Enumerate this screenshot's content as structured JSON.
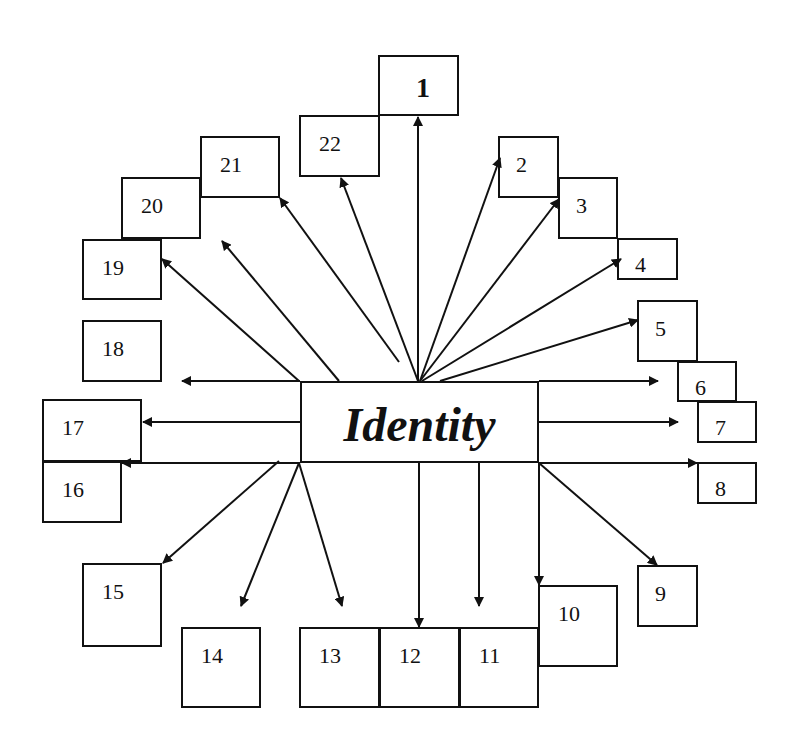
{
  "diagram": {
    "center": {
      "label": "Identity",
      "x": 300,
      "y": 381,
      "w": 239,
      "h": 82
    },
    "boxes": [
      {
        "id": "1",
        "label": "1",
        "x": 378,
        "y": 55,
        "w": 81,
        "h": 61,
        "bold": true
      },
      {
        "id": "2",
        "label": "2",
        "x": 498,
        "y": 136,
        "w": 61,
        "h": 62
      },
      {
        "id": "3",
        "label": "3",
        "x": 558,
        "y": 177,
        "w": 60,
        "h": 62
      },
      {
        "id": "4",
        "label": "4",
        "x": 617,
        "y": 238,
        "w": 61,
        "h": 42
      },
      {
        "id": "5",
        "label": "5",
        "x": 637,
        "y": 300,
        "w": 61,
        "h": 62
      },
      {
        "id": "6",
        "label": "6",
        "x": 677,
        "y": 361,
        "w": 60,
        "h": 41
      },
      {
        "id": "7",
        "label": "7",
        "x": 697,
        "y": 401,
        "w": 60,
        "h": 42
      },
      {
        "id": "8",
        "label": "8",
        "x": 697,
        "y": 462,
        "w": 60,
        "h": 42
      },
      {
        "id": "9",
        "label": "9",
        "x": 637,
        "y": 565,
        "w": 61,
        "h": 62
      },
      {
        "id": "10",
        "label": "10",
        "x": 538,
        "y": 585,
        "w": 80,
        "h": 82
      },
      {
        "id": "11",
        "label": "11",
        "x": 459,
        "y": 627,
        "w": 80,
        "h": 81
      },
      {
        "id": "12",
        "label": "12",
        "x": 379,
        "y": 627,
        "w": 81,
        "h": 81
      },
      {
        "id": "13",
        "label": "13",
        "x": 299,
        "y": 627,
        "w": 81,
        "h": 81
      },
      {
        "id": "14",
        "label": "14",
        "x": 181,
        "y": 627,
        "w": 80,
        "h": 81
      },
      {
        "id": "15",
        "label": "15",
        "x": 82,
        "y": 563,
        "w": 80,
        "h": 84
      },
      {
        "id": "16",
        "label": "16",
        "x": 42,
        "y": 461,
        "w": 80,
        "h": 62
      },
      {
        "id": "17",
        "label": "17",
        "x": 42,
        "y": 399,
        "w": 100,
        "h": 63
      },
      {
        "id": "18",
        "label": "18",
        "x": 82,
        "y": 320,
        "w": 80,
        "h": 62
      },
      {
        "id": "19",
        "label": "19",
        "x": 82,
        "y": 239,
        "w": 80,
        "h": 61
      },
      {
        "id": "20",
        "label": "20",
        "x": 121,
        "y": 177,
        "w": 80,
        "h": 62
      },
      {
        "id": "21",
        "label": "21",
        "x": 200,
        "y": 136,
        "w": 80,
        "h": 62
      },
      {
        "id": "22",
        "label": "22",
        "x": 299,
        "y": 115,
        "w": 81,
        "h": 62
      }
    ],
    "arrows": [
      {
        "to": "1",
        "x1": 418,
        "y1": 381,
        "x2": 418,
        "y2": 117
      },
      {
        "to": "2",
        "x1": 420,
        "y1": 381,
        "x2": 500,
        "y2": 158
      },
      {
        "to": "3",
        "x1": 420,
        "y1": 381,
        "x2": 559,
        "y2": 199
      },
      {
        "to": "4",
        "x1": 422,
        "y1": 381,
        "x2": 621,
        "y2": 259
      },
      {
        "to": "5",
        "x1": 440,
        "y1": 381,
        "x2": 638,
        "y2": 320
      },
      {
        "to": "6",
        "x1": 539,
        "y1": 381,
        "x2": 658,
        "y2": 381
      },
      {
        "to": "7",
        "x1": 539,
        "y1": 422,
        "x2": 678,
        "y2": 422
      },
      {
        "to": "8",
        "x1": 539,
        "y1": 463,
        "x2": 697,
        "y2": 463
      },
      {
        "to": "9",
        "x1": 539,
        "y1": 463,
        "x2": 657,
        "y2": 565
      },
      {
        "to": "10",
        "x1": 539,
        "y1": 463,
        "x2": 539,
        "y2": 585
      },
      {
        "to": "11",
        "x1": 479,
        "y1": 463,
        "x2": 479,
        "y2": 606
      },
      {
        "to": "12",
        "x1": 419,
        "y1": 463,
        "x2": 419,
        "y2": 627
      },
      {
        "to": "13",
        "x1": 299,
        "y1": 463,
        "x2": 342,
        "y2": 606
      },
      {
        "to": "14",
        "x1": 299,
        "y1": 463,
        "x2": 241,
        "y2": 606
      },
      {
        "to": "15",
        "x1": 279,
        "y1": 461,
        "x2": 163,
        "y2": 563
      },
      {
        "to": "16",
        "x1": 300,
        "y1": 463,
        "x2": 122,
        "y2": 463
      },
      {
        "to": "17",
        "x1": 300,
        "y1": 422,
        "x2": 143,
        "y2": 422
      },
      {
        "to": "18",
        "x1": 300,
        "y1": 381,
        "x2": 182,
        "y2": 381
      },
      {
        "to": "19",
        "x1": 299,
        "y1": 381,
        "x2": 162,
        "y2": 259
      },
      {
        "to": "20",
        "x1": 339,
        "y1": 381,
        "x2": 222,
        "y2": 241
      },
      {
        "to": "21",
        "x1": 399,
        "y1": 362,
        "x2": 280,
        "y2": 198
      },
      {
        "to": "22",
        "x1": 418,
        "y1": 381,
        "x2": 341,
        "y2": 178
      }
    ],
    "colors": {
      "stroke": "#111111",
      "background": "#ffffff"
    }
  }
}
